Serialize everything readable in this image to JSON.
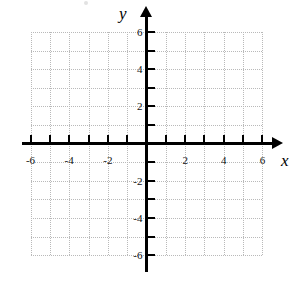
{
  "chart_data": {
    "type": "scatter",
    "title": "",
    "subtitle": "",
    "xlabel": "x",
    "ylabel": "y",
    "xlim": [
      -6,
      6
    ],
    "ylim": [
      -6,
      6
    ],
    "grid": true,
    "grid_step": 1,
    "tick_step": 1,
    "label_step": 2,
    "legend": "none",
    "series": [],
    "x_tick_labels": [
      "-6",
      "-4",
      "-2",
      "2",
      "4",
      "6"
    ],
    "x_tick_values": [
      -6,
      -4,
      -2,
      2,
      4,
      6
    ],
    "y_tick_labels": [
      "6",
      "4",
      "2",
      "-2",
      "-4",
      "-6"
    ],
    "y_tick_values": [
      6,
      4,
      2,
      -2,
      -4,
      -6
    ],
    "x_all_ticks": [
      -6,
      -5,
      -4,
      -3,
      -2,
      -1,
      1,
      2,
      3,
      4,
      5,
      6
    ],
    "y_all_ticks": [
      6,
      5,
      4,
      3,
      2,
      1,
      -1,
      -2,
      -3,
      -4,
      -5,
      -6
    ],
    "origin_label": ""
  },
  "axes": {
    "x_name": "x",
    "y_name": "y"
  },
  "colors": {
    "axis": "#000000",
    "grid": "#b9b9b9",
    "label": "#111111",
    "background": "#ffffff"
  }
}
